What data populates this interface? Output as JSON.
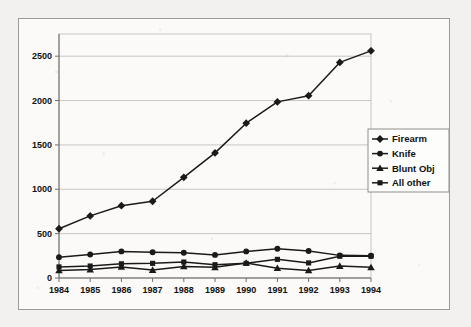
{
  "chart_data": {
    "type": "line",
    "title": "",
    "subtitle": "",
    "xlabel": "",
    "ylabel": "",
    "categories": [
      "1984",
      "1985",
      "1986",
      "1987",
      "1988",
      "1989",
      "1990",
      "1991",
      "1992",
      "1993",
      "1994"
    ],
    "x": [
      1984,
      1985,
      1986,
      1987,
      1988,
      1989,
      1990,
      1991,
      1992,
      1993,
      1994
    ],
    "ylim": [
      0,
      2750
    ],
    "yticks": [
      0,
      500,
      1000,
      1500,
      2000,
      2500
    ],
    "ytick_labels": [
      "0",
      "500",
      "1000",
      "1500",
      "2000",
      "2500"
    ],
    "xtick_labels": [
      "1984",
      "1985",
      "1986",
      "1987",
      "1988",
      "1989",
      "1990",
      "1991",
      "1992",
      "1993",
      "1994"
    ],
    "grid": "horizontal",
    "legend_position": "right",
    "series": [
      {
        "name": "Firearm",
        "marker": "diamond",
        "color": "#1a1a1a",
        "values": [
          555,
          700,
          815,
          865,
          1135,
          1410,
          1745,
          1985,
          2055,
          2430,
          2560
        ]
      },
      {
        "name": "Knife",
        "marker": "circle",
        "color": "#1a1a1a",
        "values": [
          235,
          265,
          300,
          290,
          285,
          260,
          300,
          330,
          305,
          255,
          250
        ]
      },
      {
        "name": "Blunt Obj",
        "marker": "triangle",
        "color": "#1a1a1a",
        "values": [
          85,
          95,
          125,
          90,
          130,
          120,
          170,
          110,
          85,
          135,
          120
        ]
      },
      {
        "name": "All other",
        "marker": "square",
        "color": "#1a1a1a",
        "values": [
          125,
          135,
          160,
          165,
          180,
          150,
          165,
          210,
          170,
          245,
          245
        ]
      }
    ]
  },
  "legend": {
    "items": [
      {
        "label": "Firearm",
        "marker": "diamond"
      },
      {
        "label": "Knife",
        "marker": "circle"
      },
      {
        "label": "Blunt Obj",
        "marker": "triangle"
      },
      {
        "label": "All other",
        "marker": "square"
      }
    ]
  },
  "axes": {
    "y_tick_labels": [
      "2500",
      "2000",
      "1500",
      "1000",
      "500",
      "0"
    ],
    "x_tick_labels": [
      "1984",
      "1985",
      "1986",
      "1987",
      "1988",
      "1989",
      "1990",
      "1991",
      "1992",
      "1993",
      "1994"
    ]
  },
  "style": {
    "page_background": "#f2f1ef",
    "frame_background": "#fbfaf8",
    "frame_border": "#9a9a97",
    "grid_color": "#b9b9b6",
    "axis_color": "#6f6f6c",
    "series_color": "#1a1a1a",
    "legend_border": "#8d8d8a",
    "legend_background": "#fdfdfc"
  }
}
